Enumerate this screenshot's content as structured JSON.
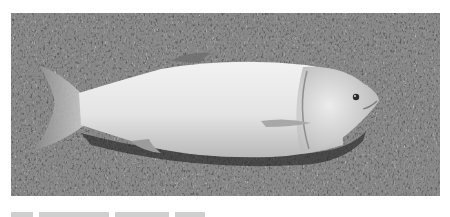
{
  "figure": {
    "colors": {
      "background": "#ffffff",
      "grass_dark": "#3a3a3a",
      "grass_light": "#9a9a9a",
      "fish_body": "#e6e6e6",
      "fish_shadow": "#b8b8b8"
    }
  },
  "caption": {
    "text": "",
    "clipped": true
  }
}
